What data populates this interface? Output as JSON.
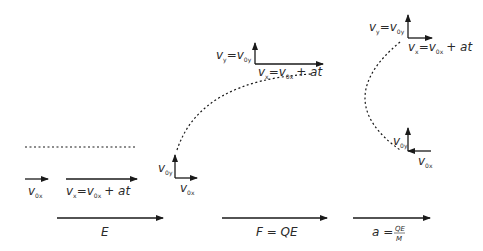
{
  "diagram": {
    "colors": {
      "line": "#1a1a1a",
      "text": "#2a2a2a",
      "background": "#ffffff"
    },
    "panel_1": {
      "initial_velocity": {
        "v": "v",
        "sub": "0x"
      },
      "final_velocity": {
        "lhs_v": "v",
        "lhs_sub": "x",
        "eq": "=",
        "rhs_v": "v",
        "rhs_sub": "0x",
        "tail": "+ at"
      },
      "field_label": "E"
    },
    "panel_2": {
      "start_vy": {
        "v": "v",
        "sub": "0y"
      },
      "start_vx": {
        "v": "v",
        "sub": "0x"
      },
      "end_vy": {
        "lhs_v": "v",
        "lhs_sub": "y",
        "eq": "=",
        "rhs_v": "v",
        "rhs_sub": "0y"
      },
      "end_vx": {
        "lhs_v": "v",
        "lhs_sub": "x",
        "eq": "=",
        "rhs_v": "v",
        "rhs_sub": "0x",
        "tail": "+ at"
      },
      "force_label": "F = QE"
    },
    "panel_3": {
      "top_vy": {
        "lhs_v": "v",
        "lhs_sub": "y",
        "eq": "=",
        "rhs_v": "v",
        "rhs_sub": "0y"
      },
      "top_vx": {
        "lhs_v": "v",
        "lhs_sub": "x",
        "eq": "=",
        "rhs_v": "v",
        "rhs_sub": "0x",
        "tail": "+ at"
      },
      "bottom_vy": {
        "v": "v",
        "sub": "0y"
      },
      "bottom_vx": {
        "v": "v",
        "sub": "0x"
      },
      "accel_lhs": "a =",
      "accel_num": "QE",
      "accel_den": "M"
    }
  }
}
